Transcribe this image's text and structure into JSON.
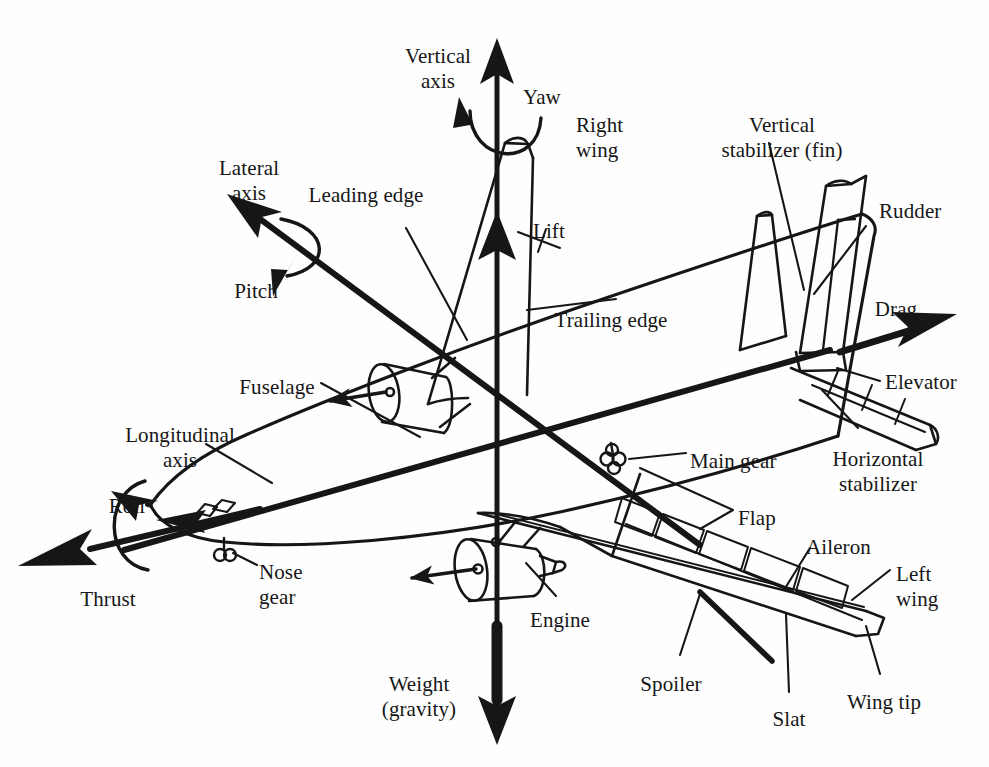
{
  "figure": {
    "kind": "aircraft-axes-and-components-diagram",
    "ink_color": "#161616",
    "background_color": "#fefefe",
    "width": 989,
    "height": 767
  },
  "labels": [
    {
      "id": "vertical-axis",
      "text": "Vertical\naxis",
      "x": 438,
      "y": 44,
      "align": "ctr"
    },
    {
      "id": "yaw",
      "text": "Yaw",
      "x": 523,
      "y": 85,
      "align": "lft"
    },
    {
      "id": "right-wing",
      "text": "Right\nwing",
      "x": 576,
      "y": 113,
      "align": "lft"
    },
    {
      "id": "vertical-stabilizer",
      "text": "Vertical\nstabilizer (fin)",
      "x": 782,
      "y": 113,
      "align": "ctr"
    },
    {
      "id": "rudder",
      "text": "Rudder",
      "x": 879,
      "y": 199,
      "align": "lft"
    },
    {
      "id": "lateral-axis",
      "text": "Lateral\naxis",
      "x": 249,
      "y": 156,
      "align": "ctr"
    },
    {
      "id": "leading-edge",
      "text": "Leading edge",
      "x": 366,
      "y": 183,
      "align": "ctr"
    },
    {
      "id": "lift",
      "text": "Lift",
      "x": 533,
      "y": 219,
      "align": "lft"
    },
    {
      "id": "pitch",
      "text": "Pitch",
      "x": 256,
      "y": 279,
      "align": "ctr"
    },
    {
      "id": "trailing-edge",
      "text": "Trailing edge",
      "x": 611,
      "y": 308,
      "align": "ctr"
    },
    {
      "id": "drag",
      "text": "Drag",
      "x": 896,
      "y": 297,
      "align": "ctr"
    },
    {
      "id": "fuselage",
      "text": "Fuselage",
      "x": 277,
      "y": 375,
      "align": "ctr"
    },
    {
      "id": "elevator",
      "text": "Elevator",
      "x": 885,
      "y": 370,
      "align": "lft"
    },
    {
      "id": "longitudinal-axis",
      "text": "Longitudinal\naxis",
      "x": 180,
      "y": 423,
      "align": "ctr"
    },
    {
      "id": "main-gear",
      "text": "Main gear",
      "x": 690,
      "y": 449,
      "align": "lft"
    },
    {
      "id": "horizontal-stabilizer",
      "text": "Horizontal\nstabilizer",
      "x": 878,
      "y": 447,
      "align": "ctr"
    },
    {
      "id": "roll",
      "text": "Roll",
      "x": 127,
      "y": 494,
      "align": "ctr"
    },
    {
      "id": "flap",
      "text": "Flap",
      "x": 738,
      "y": 506,
      "align": "lft"
    },
    {
      "id": "aileron",
      "text": "Aileron",
      "x": 806,
      "y": 535,
      "align": "lft"
    },
    {
      "id": "left-wing",
      "text": "Left\nwing",
      "x": 896,
      "y": 562,
      "align": "lft"
    },
    {
      "id": "nose-gear",
      "text": "Nose\ngear",
      "x": 259,
      "y": 560,
      "align": "lft"
    },
    {
      "id": "thrust",
      "text": "Thrust",
      "x": 108,
      "y": 587,
      "align": "ctr"
    },
    {
      "id": "engine",
      "text": "Engine",
      "x": 560,
      "y": 608,
      "align": "ctr"
    },
    {
      "id": "weight-gravity",
      "text": "Weight\n(gravity)",
      "x": 419,
      "y": 672,
      "align": "ctr"
    },
    {
      "id": "spoiler",
      "text": "Spoiler",
      "x": 671,
      "y": 672,
      "align": "ctr"
    },
    {
      "id": "slat",
      "text": "Slat",
      "x": 789,
      "y": 707,
      "align": "ctr"
    },
    {
      "id": "wing-tip",
      "text": "Wing tip",
      "x": 884,
      "y": 690,
      "align": "ctr"
    }
  ],
  "axes": [
    {
      "id": "vertical-axis",
      "label": "Vertical axis",
      "rotation": "Yaw",
      "force_up": "Lift",
      "force_down": "Weight (gravity)"
    },
    {
      "id": "lateral-axis",
      "label": "Lateral axis",
      "rotation": "Pitch",
      "force_up": null,
      "force_down": null
    },
    {
      "id": "longitudinal-axis",
      "label": "Longitudinal axis",
      "rotation": "Roll",
      "force_up": "Drag",
      "force_down": "Thrust"
    }
  ],
  "components": [
    "Right wing",
    "Left wing",
    "Wing tip",
    "Fuselage",
    "Engine",
    "Nose gear",
    "Main gear",
    "Vertical stabilizer (fin)",
    "Rudder",
    "Horizontal stabilizer",
    "Elevator",
    "Leading edge",
    "Trailing edge",
    "Flap",
    "Slat",
    "Spoiler",
    "Aileron"
  ],
  "forces": [
    "Lift",
    "Weight (gravity)",
    "Thrust",
    "Drag"
  ],
  "rotations": [
    "Yaw",
    "Pitch",
    "Roll"
  ]
}
